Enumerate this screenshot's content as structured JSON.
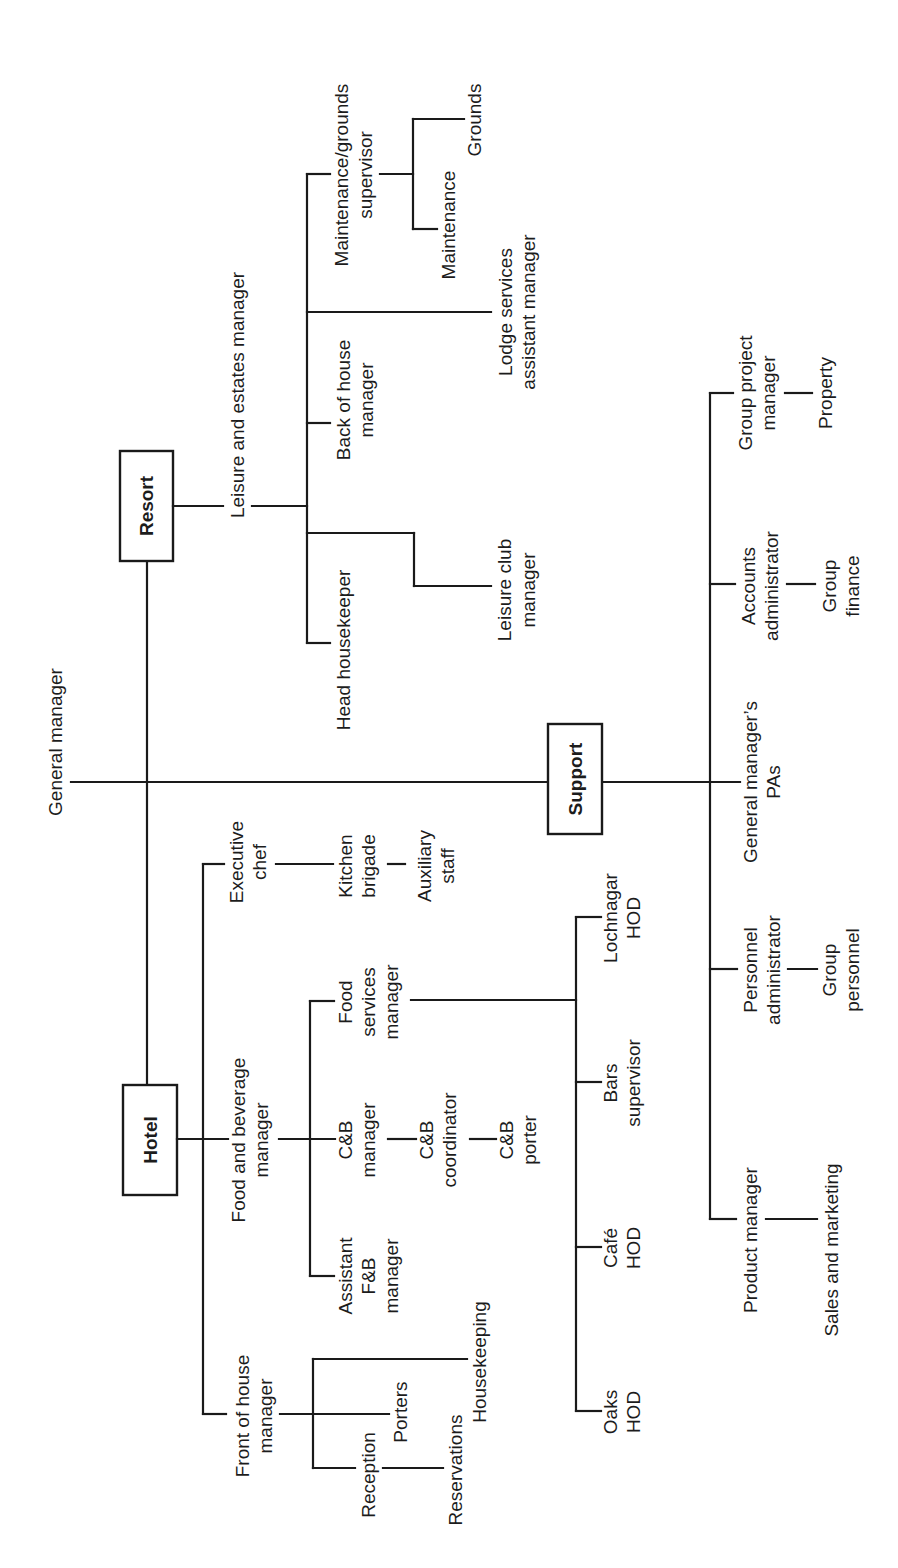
{
  "chart": {
    "orientation": "rotated 90 degrees counter-clockwise",
    "root": {
      "label": "General manager",
      "children": [
        {
          "label": "Resort",
          "boxed": true,
          "children": [
            {
              "label": "Leisure and estates manager",
              "children": [
                {
                  "label": [
                    "Maintenance/grounds",
                    "supervisor"
                  ],
                  "children": [
                    {
                      "label": "Maintenance"
                    },
                    {
                      "label": "Grounds"
                    }
                  ]
                },
                {
                  "label": [
                    "Lodge services",
                    "assistant manager"
                  ]
                },
                {
                  "label": [
                    "Back of house",
                    "manager"
                  ]
                },
                {
                  "label": [
                    "Leisure club",
                    "manager"
                  ]
                },
                {
                  "label": "Head housekeeper"
                }
              ]
            }
          ]
        },
        {
          "label": "Hotel",
          "boxed": true,
          "children": [
            {
              "label": [
                "Executive",
                "chef"
              ],
              "children": [
                {
                  "label": [
                    "Kitchen",
                    "brigade"
                  ],
                  "children": [
                    {
                      "label": [
                        "Auxiliary",
                        "staff"
                      ]
                    }
                  ]
                }
              ]
            },
            {
              "label": [
                "Food and beverage",
                "manager"
              ],
              "children": [
                {
                  "label": [
                    "Food",
                    "services",
                    "manager"
                  ],
                  "children": [
                    {
                      "label": [
                        "Lochnagar",
                        "HOD"
                      ]
                    },
                    {
                      "label": [
                        "Bars",
                        "supervisor"
                      ]
                    },
                    {
                      "label": [
                        "Café",
                        "HOD"
                      ]
                    },
                    {
                      "label": [
                        "Oaks",
                        "HOD"
                      ]
                    }
                  ]
                },
                {
                  "label": [
                    "C&B",
                    "manager"
                  ],
                  "children": [
                    {
                      "label": [
                        "C&B",
                        "coordinator"
                      ],
                      "children": [
                        {
                          "label": [
                            "C&B",
                            "porter"
                          ]
                        }
                      ]
                    }
                  ]
                },
                {
                  "label": [
                    "Assistant",
                    "F&B",
                    "manager"
                  ]
                }
              ]
            },
            {
              "label": [
                "Front of house",
                "manager"
              ],
              "children": [
                {
                  "label": "Housekeeping"
                },
                {
                  "label": "Porters"
                },
                {
                  "label": "Reception",
                  "children": [
                    {
                      "label": "Reservations"
                    }
                  ]
                }
              ]
            }
          ]
        },
        {
          "label": "Support",
          "boxed": true,
          "children": [
            {
              "label": [
                "Group project",
                "manager"
              ],
              "children": [
                {
                  "label": "Property"
                }
              ]
            },
            {
              "label": [
                "Accounts",
                "administrator"
              ],
              "children": [
                {
                  "label": [
                    "Group",
                    "finance"
                  ]
                }
              ]
            },
            {
              "label": [
                "General manager's",
                "PAs"
              ]
            },
            {
              "label": [
                "Personnel",
                "administrator"
              ],
              "children": [
                {
                  "label": [
                    "Group",
                    "personnel"
                  ]
                }
              ]
            },
            {
              "label": "Product manager",
              "children": [
                {
                  "label": "Sales and marketing"
                }
              ]
            }
          ]
        }
      ]
    }
  },
  "labels": {
    "general_manager": "General manager",
    "resort": "Resort",
    "hotel": "Hotel",
    "support": "Support",
    "leisure_estates": "Leisure and estates manager",
    "maint_grounds_1": "Maintenance/grounds",
    "maint_grounds_2": "supervisor",
    "maintenance": "Maintenance",
    "grounds": "Grounds",
    "lodge_1": "Lodge services",
    "lodge_2": "assistant manager",
    "back_house_1": "Back of house",
    "back_house_2": "manager",
    "leisure_club_1": "Leisure club",
    "leisure_club_2": "manager",
    "head_housekeeper": "Head housekeeper",
    "exec_chef_1": "Executive",
    "exec_chef_2": "chef",
    "kitchen_1": "Kitchen",
    "kitchen_2": "brigade",
    "aux_1": "Auxiliary",
    "aux_2": "staff",
    "fb_1": "Food and beverage",
    "fb_2": "manager",
    "food_serv_1": "Food",
    "food_serv_2": "services",
    "food_serv_3": "manager",
    "cb_mgr_1": "C&B",
    "cb_mgr_2": "manager",
    "cb_coord_1": "C&B",
    "cb_coord_2": "coordinator",
    "cb_porter_1": "C&B",
    "cb_porter_2": "porter",
    "asst_fb_1": "Assistant",
    "asst_fb_2": "F&B",
    "asst_fb_3": "manager",
    "lochnagar_1": "Lochnagar",
    "lochnagar_2": "HOD",
    "bars_1": "Bars",
    "bars_2": "supervisor",
    "cafe_1": "Café",
    "cafe_2": "HOD",
    "oaks_1": "Oaks",
    "oaks_2": "HOD",
    "foh_1": "Front of house",
    "foh_2": "manager",
    "housekeeping": "Housekeeping",
    "porters": "Porters",
    "reception": "Reception",
    "reservations": "Reservations",
    "gpm_1": "Group project",
    "gpm_2": "manager",
    "property": "Property",
    "accounts_1": "Accounts",
    "accounts_2": "administrator",
    "gfin_1": "Group",
    "gfin_2": "finance",
    "gmpa_1": "General manager’s",
    "gmpa_2": "PAs",
    "personnel_1": "Personnel",
    "personnel_2": "administrator",
    "gpers_1": "Group",
    "gpers_2": "personnel",
    "product_mgr": "Product manager",
    "sales_mkt": "Sales and marketing"
  }
}
